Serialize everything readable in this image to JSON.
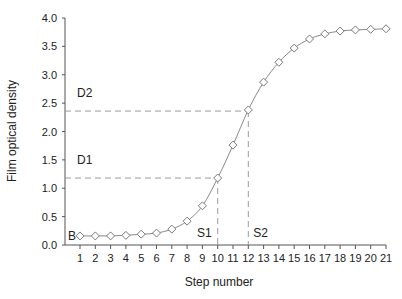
{
  "chart_data": {
    "type": "line",
    "title": "",
    "xlabel": "Step number",
    "ylabel": "Film optical density",
    "x": [
      1,
      2,
      3,
      4,
      5,
      6,
      7,
      8,
      9,
      10,
      11,
      12,
      13,
      14,
      15,
      16,
      17,
      18,
      19,
      20,
      21
    ],
    "series": [
      {
        "name": "Characteristic curve",
        "marker": "diamond-open",
        "values": [
          0.16,
          0.16,
          0.16,
          0.17,
          0.19,
          0.21,
          0.28,
          0.42,
          0.69,
          1.18,
          1.76,
          2.38,
          2.87,
          3.22,
          3.47,
          3.63,
          3.72,
          3.77,
          3.79,
          3.8,
          3.81
        ]
      }
    ],
    "xlim": [
      0.5,
      21
    ],
    "ylim": [
      0.0,
      4.0
    ],
    "x_ticks": [
      "1",
      "2",
      "3",
      "4",
      "5",
      "6",
      "7",
      "8",
      "9",
      "10",
      "11",
      "12",
      "13",
      "14",
      "15",
      "16",
      "17",
      "18",
      "19",
      "20",
      "21"
    ],
    "y_ticks": [
      "0.0",
      "0.5",
      "1.0",
      "1.5",
      "2.0",
      "2.5",
      "3.0",
      "3.5",
      "4.0"
    ],
    "y_tick_values": [
      0.0,
      0.5,
      1.0,
      1.5,
      2.0,
      2.5,
      3.0,
      3.5,
      4.0
    ],
    "grid": false,
    "legend": null,
    "annotations": [
      {
        "label": "B",
        "type": "point-label",
        "x": 1,
        "y": 0.16
      },
      {
        "label": "D1",
        "type": "hline",
        "y": 1.18,
        "x_end": 10
      },
      {
        "label": "D2",
        "type": "hline",
        "y": 2.36,
        "x_end": 12
      },
      {
        "label": "S1",
        "type": "vline",
        "x": 10,
        "y_end": 1.18
      },
      {
        "label": "S2",
        "type": "vline",
        "x": 12,
        "y_end": 2.36
      }
    ]
  },
  "colors": {
    "line": "#8a8a8a",
    "marker_stroke": "#7a7a7a",
    "marker_fill": "#ffffff",
    "axis": "#555555",
    "dashed": "#9a9a9a",
    "text": "#222222"
  }
}
